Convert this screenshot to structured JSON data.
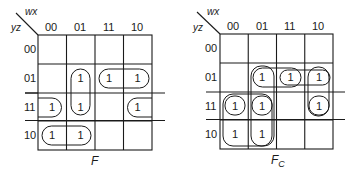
{
  "maps": [
    {
      "id": "F",
      "caption": "F",
      "caption_sub": "",
      "col_var": "wx",
      "row_var": "yz",
      "col_labels": [
        "00",
        "01",
        "11",
        "10"
      ],
      "row_labels": [
        "00",
        "01",
        "11",
        "10"
      ],
      "cells": [
        [
          "",
          "",
          "",
          ""
        ],
        [
          "",
          "1",
          "1",
          "1"
        ],
        [
          "1",
          "1",
          "",
          "1"
        ],
        [
          "1",
          "1",
          "",
          ""
        ]
      ],
      "groups": [
        {
          "desc": "column 01, rows 01-11 (vertical pair)"
        },
        {
          "desc": "row 01, columns 11-10 (horizontal pair)"
        },
        {
          "desc": "row 11, columns 00 and 10 (wrap-around pair)"
        },
        {
          "desc": "row 10, columns 00-01 (horizontal pair)"
        }
      ]
    },
    {
      "id": "Fc",
      "caption": "F",
      "caption_sub": "C",
      "col_var": "wx",
      "row_var": "yz",
      "col_labels": [
        "00",
        "01",
        "11",
        "10"
      ],
      "row_labels": [
        "00",
        "01",
        "11",
        "10"
      ],
      "cells": [
        [
          "",
          "",
          "",
          ""
        ],
        [
          "",
          "1",
          "1",
          "1"
        ],
        [
          "1",
          "1",
          "",
          "1"
        ],
        [
          "1",
          "1",
          "",
          ""
        ]
      ],
      "groups": [
        {
          "desc": "column 01, rows 01-10 (vertical quad)"
        },
        {
          "desc": "row 01, columns 01-11 (horizontal pair)"
        },
        {
          "desc": "row 01, columns 11-10 (horizontal pair)"
        },
        {
          "desc": "column 10, rows 01-11 (vertical pair)"
        },
        {
          "desc": "columns 00-01, rows 11-10 (square quad)"
        },
        {
          "desc": "row 11, columns 00 and 10 (wrap-around pair)"
        }
      ]
    }
  ]
}
